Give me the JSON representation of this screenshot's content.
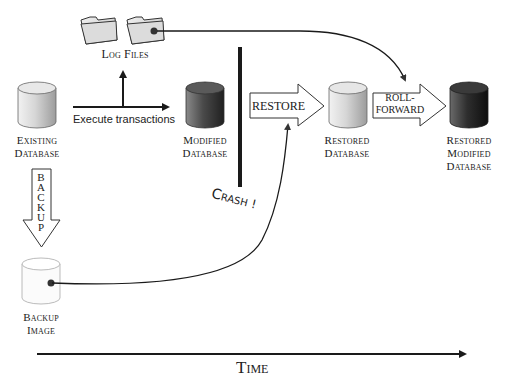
{
  "diagram": {
    "nodes": {
      "log_files": {
        "label": "Log Files"
      },
      "existing_db": {
        "line1": "Existing",
        "line2": "Database"
      },
      "modified_db": {
        "line1": "Modified",
        "line2": "Database"
      },
      "restored_db": {
        "line1": "Restored",
        "line2": "Database"
      },
      "restored_modified_db": {
        "line1": "Restored",
        "line2": "Modified",
        "line3": "Database"
      },
      "backup_image": {
        "line1": "Backup",
        "line2": "Image"
      }
    },
    "edges": {
      "execute": {
        "label": "Execute transactions"
      },
      "backup": {
        "letters": [
          "B",
          "A",
          "C",
          "K",
          "U",
          "P"
        ]
      },
      "restore": {
        "label": "RESTORE"
      },
      "roll_forward": {
        "line1": "ROLL-",
        "line2": "FORWARD"
      }
    },
    "event": {
      "crash": "Crash!",
      "crash_c": "C",
      "crash_rest": "RASH",
      "crash_bang": "!"
    },
    "axis": {
      "label": "Time"
    },
    "colors": {
      "existing_db": "#c9c9c9",
      "modified_db": "#4a4a4a",
      "restored_db": "#d4d4d4",
      "restored_modified_db": "#2a2a2a",
      "backup_image": "#ffffff",
      "line": "#1a1a1a"
    }
  }
}
